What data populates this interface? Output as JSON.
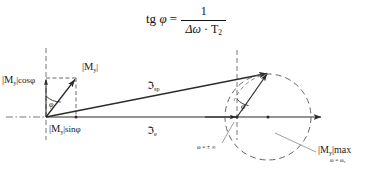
{
  "figure": {
    "type": "phasor-vector-diagram",
    "title_formula": {
      "lhs": "tg",
      "lhs_var": "φ",
      "equals": "=",
      "numerator": "1",
      "denominator_delta_omega": "Δω",
      "denominator_dot": "·",
      "denominator_T": "T",
      "denominator_T_sub": "2"
    },
    "labels": {
      "my_cos_phi": "|Mᵧ|cosφ",
      "my": "|Mᵧ|",
      "my_sin_phi": "|Mᵧ|sinφ",
      "phi_left": "φ",
      "phi_right": "φ",
      "j_sp": "ℑsp",
      "j_e": "ℑe",
      "omega_infinity": "ω = ± ∞",
      "my_max": "|Mᵧ|max",
      "omega_zero": "ω = ω₀"
    },
    "label_parts": {
      "my_cos_phi_bar": "|M",
      "my_cos_phi_sub": "y",
      "my_cos_phi_rest": "|cosφ",
      "my_bar": "|M",
      "my_sub": "y",
      "my_rest": "|",
      "my_sin_phi_bar": "|M",
      "my_sin_phi_sub": "y",
      "my_sin_phi_rest": "|sinφ",
      "j_glyph": "ℑ",
      "j_sp_sub": "sp",
      "j_e_sub": "e",
      "my_max_bar": "|M",
      "my_max_sub": "y",
      "my_max_rest": "|max"
    },
    "colors": {
      "ink": "#1a1a1a",
      "stroke": "#2b2b2b",
      "dash": "#555555",
      "background": "#ffffff"
    },
    "geometry": {
      "origin_x": 46,
      "origin_y": 117,
      "axis_end_x": 322,
      "tip_right_x": 268,
      "tip_right_y": 73,
      "vertex_right_x": 237,
      "my_tip_x": 76,
      "my_tip_y": 78,
      "circle_cx": 268,
      "circle_cy": 117,
      "circle_r": 43
    }
  }
}
